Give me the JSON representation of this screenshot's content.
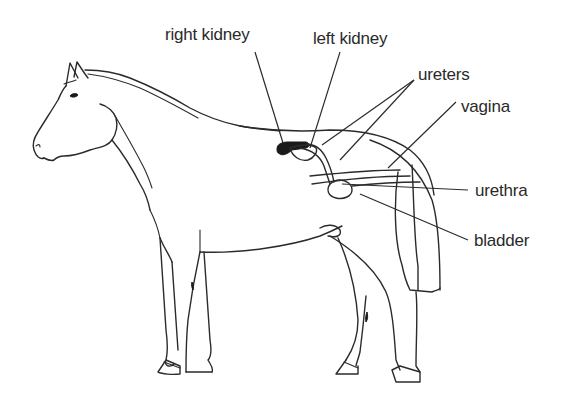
{
  "diagram": {
    "style": "black line drawing on white background",
    "labels": [
      {
        "id": "right-kidney",
        "text": "right kidney"
      },
      {
        "id": "left-kidney",
        "text": "left kidney"
      },
      {
        "id": "ureters",
        "text": "ureters"
      },
      {
        "id": "vagina",
        "text": "vagina"
      },
      {
        "id": "urethra",
        "text": "urethra"
      },
      {
        "id": "bladder",
        "text": "bladder"
      }
    ]
  },
  "colors": {
    "background": "#ffffff",
    "line": "#2b2b2b",
    "kidney_fill": "#1a1a1a"
  }
}
